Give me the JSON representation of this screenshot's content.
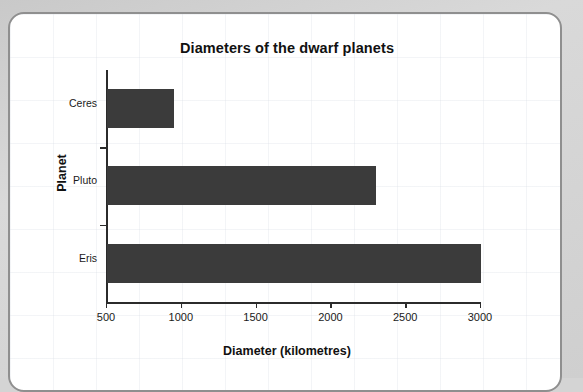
{
  "chart_data": {
    "type": "bar",
    "orientation": "horizontal",
    "title": "Diameters of the dwarf planets",
    "xlabel": "Diameter (kilometres)",
    "ylabel": "Planet",
    "categories": [
      "Ceres",
      "Pluto",
      "Eris"
    ],
    "values": [
      950,
      2300,
      3000
    ],
    "xlim": [
      500,
      3000
    ],
    "xticks": [
      500,
      1000,
      1500,
      2000,
      2500,
      3000
    ],
    "xtick_labels": [
      "500",
      "1000",
      "1500",
      "2000",
      "2500",
      "3000"
    ],
    "grid": false,
    "legend": null,
    "bar_color": "#3b3b3b",
    "axis_color": "#2b2b2b",
    "background_color": "#ffffff"
  },
  "card": {
    "border_color": "#8f8f8f",
    "page_background": "#d4d4d4"
  }
}
